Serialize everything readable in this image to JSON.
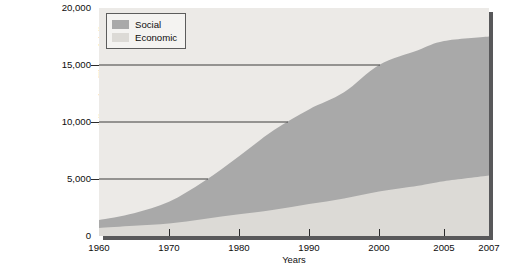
{
  "caption": {
    "title_lines": [
      "S.",
      "ivities"
    ],
    "body_lines": [
      {
        "text": "and",
        "italic": false
      },
      {
        "text": "derating",
        "italic": false
      },
      {
        "text": "n",
        "italic": false
      },
      {
        "text": "udget for",
        "italic": false
      },
      {
        "text": "2007,”",
        "italic": false
      },
      {
        "text": "ort 28,",
        "italic": true
      }
    ]
  },
  "chart_data": {
    "type": "area",
    "stacked": true,
    "title": "",
    "xlabel": "Years",
    "ylabel": "Constant year 2000 dollars, in millions of dollars",
    "ylim": [
      0,
      20000
    ],
    "yticks": [
      0,
      5000,
      10000,
      15000,
      20000
    ],
    "ytick_labels": [
      "0",
      "5,000",
      "10,000",
      "15,000",
      "20,000"
    ],
    "xticks": [
      1960,
      1970,
      1980,
      1990,
      2000,
      2005,
      2007
    ],
    "xtick_labels": [
      "1960",
      "1970",
      "1980",
      "1990",
      "2000",
      "2005",
      "2007"
    ],
    "x": [
      1960,
      1965,
      1970,
      1975,
      1980,
      1985,
      1990,
      1995,
      2000,
      2003,
      2005,
      2007
    ],
    "grid": "horizontal",
    "legend_position": "top-left",
    "series": [
      {
        "name": "Economic",
        "color": "#dcdad6",
        "values": [
          700,
          900,
          1100,
          1500,
          1900,
          2300,
          2800,
          3300,
          3900,
          4400,
          4800,
          5300
        ]
      },
      {
        "name": "Social",
        "color": "#a9a9a9",
        "values": [
          700,
          1100,
          1900,
          3300,
          5100,
          7000,
          8300,
          9300,
          11100,
          11900,
          12300,
          12200
        ]
      }
    ],
    "totals": [
      1400,
      2000,
      3000,
      4800,
      7000,
      9300,
      11100,
      12600,
      15000,
      16300,
      17100,
      17500
    ]
  },
  "legend": {
    "items": [
      {
        "label": "Social",
        "color": "#a9a9a9"
      },
      {
        "label": "Economic",
        "color": "#dcdad6"
      }
    ]
  },
  "colors": {
    "plot_background": "#eceae7",
    "shadow": "#58585a",
    "gridline": "#3d3d3d",
    "axis": "#2a2a2a",
    "social": "#a9a9a9",
    "economic": "#dcdad6"
  }
}
